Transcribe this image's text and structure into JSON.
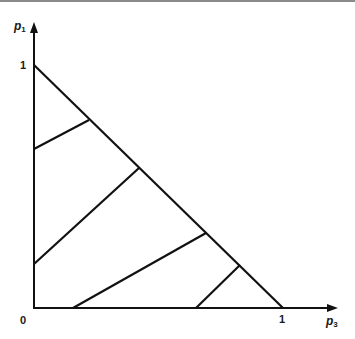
{
  "diagram": {
    "type": "probability-simplex",
    "y_axis": {
      "label": "p",
      "subscript": "1",
      "tick_top": "1"
    },
    "x_axis": {
      "label": "p",
      "subscript": "3",
      "tick_right": "1"
    },
    "origin_label": "0",
    "colors": {
      "line": "#111111",
      "background": "#ffffff",
      "top_rule": "#8a8a8a"
    },
    "hypotenuse": {
      "from": [
        0,
        1
      ],
      "to": [
        1,
        0
      ]
    },
    "parallel_lines": [
      {
        "from": [
          0,
          0.66
        ],
        "to": [
          0.22,
          0.78
        ]
      },
      {
        "from": [
          0,
          0.18
        ],
        "to": [
          0.42,
          0.58
        ]
      },
      {
        "from": [
          0.16,
          0
        ],
        "to": [
          0.69,
          0.31
        ]
      },
      {
        "from": [
          0.65,
          0
        ],
        "to": [
          0.82,
          0.18
        ]
      }
    ]
  }
}
